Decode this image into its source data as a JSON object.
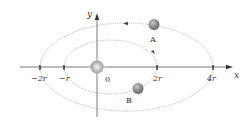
{
  "diagram": {
    "type": "orbit-diagram",
    "axes": {
      "x_label": "x",
      "y_label": "y",
      "origin_label": "0"
    },
    "ticks": [
      {
        "label": "−2r",
        "value": -2
      },
      {
        "label": "−r",
        "value": -1
      },
      {
        "label": "2r",
        "value": 2
      },
      {
        "label": "4r",
        "value": 4
      }
    ],
    "central_body": {
      "name": "central-star",
      "position": "origin"
    },
    "orbits": [
      {
        "name": "outer-orbit",
        "x_min": "−2r",
        "x_max": "4r",
        "direction": "counterclockwise"
      },
      {
        "name": "inner-orbit",
        "x_min": "−r",
        "x_max": "2r",
        "direction": "clockwise"
      }
    ],
    "satellites": [
      {
        "label": "A",
        "orbit": "outer-orbit"
      },
      {
        "label": "B",
        "orbit": "inner-orbit"
      }
    ],
    "colors": {
      "axis": "#555555",
      "orbit": "#7a7a7a",
      "satellite": "#8a8a8a",
      "star": "#cfcfcf"
    }
  }
}
